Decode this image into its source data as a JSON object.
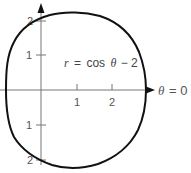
{
  "figure": {
    "curve_label": {
      "r": "r",
      "eq": "=",
      "cos": "cos",
      "theta": "θ",
      "rest": "− 2"
    },
    "axis_label": {
      "theta": "θ",
      "rest": "= 0"
    },
    "x_ticks": [
      "1",
      "2"
    ],
    "y_ticks_up": [
      "1",
      "2"
    ],
    "y_ticks_down": [
      "1",
      "2"
    ],
    "colors": {
      "curve": "#111111",
      "axis": "#666666",
      "arrow": "#111111",
      "text": "#555555"
    }
  }
}
